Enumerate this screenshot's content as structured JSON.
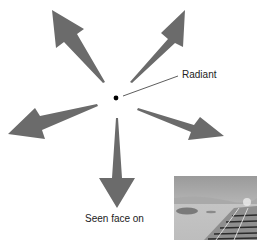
{
  "labels": {
    "radiant": "Radiant",
    "seen_face_on": "Seen face on"
  },
  "colors": {
    "arrow": "#6b6b6b",
    "dot": "#000000",
    "leader": "#333333"
  },
  "diagram": {
    "center": [
      116,
      98
    ],
    "arrows": [
      {
        "name": "upper-left",
        "tail": [
          105,
          82
        ],
        "tip": [
          52,
          10
        ]
      },
      {
        "name": "upper-right",
        "tail": [
          130,
          82
        ],
        "tip": [
          185,
          10
        ]
      },
      {
        "name": "left",
        "tail": [
          97,
          104
        ],
        "tip": [
          8,
          134
        ]
      },
      {
        "name": "right",
        "tail": [
          138,
          108
        ],
        "tip": [
          224,
          136
        ]
      },
      {
        "name": "down",
        "tail": [
          117,
          118
        ],
        "tip": [
          117,
          208
        ]
      }
    ]
  },
  "photo": {
    "description": "grayscale view along railway track toward horizon"
  }
}
